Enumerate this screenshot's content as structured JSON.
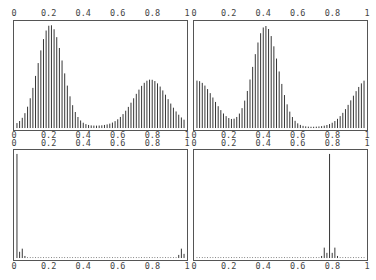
{
  "chart_data": [
    {
      "type": "bar",
      "panel": "top-left",
      "title": "",
      "xlabel": "",
      "ylabel": "",
      "xlim": [
        0,
        1
      ],
      "x_ticks": [
        "0",
        "0.2",
        "0.4",
        "0.6",
        "0.8",
        "1"
      ],
      "description": "Bimodal distribution: tall peak near x=0.2 (relative height 1.0), smaller peak near x=0.8 (relative height ~0.45), minimum ~0.03 near x=0.45-0.5",
      "components": [
        {
          "center": 0.2,
          "width": 0.075,
          "height": 0.98
        },
        {
          "center": 0.8,
          "width": 0.1,
          "height": 0.45
        }
      ],
      "baseline": 0.02,
      "n_bars": 64
    },
    {
      "type": "bar",
      "panel": "top-right",
      "title": "",
      "xlabel": "",
      "ylabel": "",
      "xlim": [
        0,
        1
      ],
      "x_ticks": [
        "0",
        "0.2",
        "0.4",
        "0.6",
        "0.8",
        "1"
      ],
      "description": "Central peak near x=0.41 (relative height 1.0), ~0.45 height at both edges x=0 and x=1, minima near x=0.22 and x=0.66",
      "components": [
        {
          "center": 0.41,
          "width": 0.075,
          "height": 0.98
        },
        {
          "center": 0.0,
          "width": 0.1,
          "height": 0.45
        },
        {
          "center": 1.03,
          "width": 0.1,
          "height": 0.47
        }
      ],
      "baseline": 0.01,
      "n_bars": 64
    },
    {
      "type": "bar",
      "panel": "bottom-left",
      "title": "",
      "xlabel": "",
      "ylabel": "",
      "xlim": [
        0,
        1
      ],
      "x_ticks": [
        "0",
        "0.2",
        "0.4",
        "0.6",
        "0.8",
        "1"
      ],
      "description": "Nearly all mass at x=0 (full-height spike), tiny side spikes near x=0.02-0.04 and x=0.97-0.99, dotted near-zero baseline elsewhere",
      "spikes": [
        {
          "x": 0.0,
          "h": 1.0
        },
        {
          "x": 0.016,
          "h": 0.06
        },
        {
          "x": 0.032,
          "h": 0.09
        },
        {
          "x": 0.048,
          "h": 0.02
        },
        {
          "x": 0.968,
          "h": 0.03
        },
        {
          "x": 0.984,
          "h": 0.09
        },
        {
          "x": 1.0,
          "h": 0.04
        }
      ],
      "baseline": 0.005,
      "n_bars": 64
    },
    {
      "type": "bar",
      "panel": "bottom-right",
      "title": "",
      "xlabel": "",
      "ylabel": "",
      "xlim": [
        0,
        1
      ],
      "x_ticks": [
        "0",
        "0.2",
        "0.4",
        "0.6",
        "0.8",
        "1"
      ],
      "description": "Single dominant spike at x≈0.79 (full height), small side spikes around x=0.75-0.83, dotted near-zero baseline elsewhere",
      "spikes": [
        {
          "x": 0.746,
          "h": 0.02
        },
        {
          "x": 0.762,
          "h": 0.1
        },
        {
          "x": 0.778,
          "h": 0.05
        },
        {
          "x": 0.794,
          "h": 1.0
        },
        {
          "x": 0.81,
          "h": 0.05
        },
        {
          "x": 0.825,
          "h": 0.1
        },
        {
          "x": 0.841,
          "h": 0.02
        }
      ],
      "baseline": 0.005,
      "n_bars": 64
    }
  ]
}
